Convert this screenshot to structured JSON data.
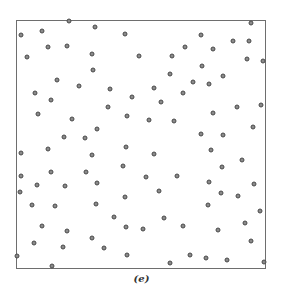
{
  "chart_data": {
    "type": "scatter",
    "title": "",
    "caption": "(e)",
    "xlabel": "",
    "ylabel": "",
    "xlim": [
      0,
      1
    ],
    "ylim": [
      0,
      1
    ],
    "grid": false,
    "legend": null,
    "frame_px": {
      "left": 16,
      "top": 20,
      "width": 250,
      "height": 249
    },
    "points_px": [
      [
        69,
        21
      ],
      [
        95,
        27
      ],
      [
        42,
        31
      ],
      [
        21,
        35
      ],
      [
        125,
        34
      ],
      [
        251,
        23
      ],
      [
        201,
        35
      ],
      [
        233,
        41
      ],
      [
        249,
        41
      ],
      [
        48,
        47
      ],
      [
        67,
        46
      ],
      [
        185,
        47
      ],
      [
        213,
        49
      ],
      [
        27,
        57
      ],
      [
        92,
        54
      ],
      [
        139,
        56
      ],
      [
        172,
        56
      ],
      [
        247,
        59
      ],
      [
        263,
        61
      ],
      [
        93,
        70
      ],
      [
        170,
        74
      ],
      [
        202,
        66
      ],
      [
        223,
        76
      ],
      [
        57,
        80
      ],
      [
        79,
        86
      ],
      [
        110,
        89
      ],
      [
        154,
        88
      ],
      [
        193,
        82
      ],
      [
        209,
        84
      ],
      [
        35,
        93
      ],
      [
        51,
        100
      ],
      [
        132,
        97
      ],
      [
        161,
        102
      ],
      [
        183,
        93
      ],
      [
        108,
        107
      ],
      [
        237,
        107
      ],
      [
        261,
        105
      ],
      [
        38,
        114
      ],
      [
        72,
        119
      ],
      [
        127,
        116
      ],
      [
        149,
        120
      ],
      [
        174,
        121
      ],
      [
        213,
        113
      ],
      [
        97,
        129
      ],
      [
        253,
        127
      ],
      [
        64,
        137
      ],
      [
        85,
        138
      ],
      [
        201,
        134
      ],
      [
        223,
        135
      ],
      [
        21,
        153
      ],
      [
        48,
        149
      ],
      [
        126,
        147
      ],
      [
        92,
        155
      ],
      [
        154,
        154
      ],
      [
        211,
        150
      ],
      [
        242,
        160
      ],
      [
        123,
        166
      ],
      [
        222,
        167
      ],
      [
        21,
        176
      ],
      [
        51,
        172
      ],
      [
        86,
        172
      ],
      [
        146,
        177
      ],
      [
        177,
        176
      ],
      [
        37,
        185
      ],
      [
        65,
        186
      ],
      [
        97,
        183
      ],
      [
        209,
        182
      ],
      [
        254,
        184
      ],
      [
        20,
        192
      ],
      [
        159,
        191
      ],
      [
        221,
        193
      ],
      [
        238,
        196
      ],
      [
        125,
        197
      ],
      [
        32,
        205
      ],
      [
        55,
        206
      ],
      [
        96,
        204
      ],
      [
        208,
        205
      ],
      [
        260,
        211
      ],
      [
        114,
        217
      ],
      [
        164,
        218
      ],
      [
        42,
        226
      ],
      [
        67,
        231
      ],
      [
        126,
        227
      ],
      [
        143,
        229
      ],
      [
        183,
        226
      ],
      [
        218,
        230
      ],
      [
        245,
        223
      ],
      [
        34,
        243
      ],
      [
        63,
        247
      ],
      [
        92,
        238
      ],
      [
        104,
        248
      ],
      [
        251,
        241
      ],
      [
        17,
        256
      ],
      [
        127,
        255
      ],
      [
        190,
        255
      ],
      [
        206,
        258
      ],
      [
        227,
        260
      ],
      [
        52,
        266
      ],
      [
        170,
        263
      ],
      [
        264,
        262
      ]
    ]
  }
}
